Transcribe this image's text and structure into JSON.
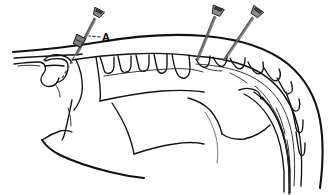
{
  "figure": {
    "title": "Lateral view of canine cervicothoracic vertebral column with transarticular screw fixation",
    "view": "lateral",
    "background_color": "#ffffff",
    "ink_color": "#111111",
    "metal_color": "#8a8a8a",
    "labels": [
      {
        "id": "label-a",
        "text": "A",
        "x": 104,
        "y": 40,
        "leader_from": [
          100,
          38
        ],
        "leader_to": [
          90,
          36
        ],
        "description": "screw at C1-C2 articulation"
      }
    ],
    "screws": [
      {
        "id": "screw-1",
        "name": "atlantoaxial-screw",
        "head_x": 97,
        "head_y": 13,
        "tip_x": 74,
        "tip_y": 56,
        "angle_deg": 208,
        "has_buried_head": true,
        "buried_head_x": 79,
        "buried_head_y": 41
      },
      {
        "id": "screw-2",
        "name": "caudal-cervical-screw-left",
        "head_x": 217,
        "head_y": 11,
        "tip_x": 196,
        "tip_y": 60,
        "angle_deg": 203
      },
      {
        "id": "screw-3",
        "name": "caudal-cervical-screw-right",
        "head_x": 256,
        "head_y": 12,
        "tip_x": 222,
        "tip_y": 60,
        "angle_deg": 214
      }
    ],
    "anatomy": {
      "structures": [
        "dorsal skin contour / nuchal ligament line",
        "occiput and skull base",
        "atlas (C1) wing",
        "axis (C2) spinous process",
        "cervical vertebrae C3-C7 spinous processes",
        "thoracic vertebrae T1-T6 with dorsal spinous processes",
        "scapula outline",
        "ribs",
        "sternum / ventral thoracic contour",
        "mandible / ventral neck contour"
      ],
      "dotted_trajectory": {
        "id": "trajectory-1",
        "description": "intended drill trajectory through atlantoaxial joint",
        "from": [
          74,
          56
        ],
        "to": [
          58,
          82
        ]
      }
    }
  }
}
